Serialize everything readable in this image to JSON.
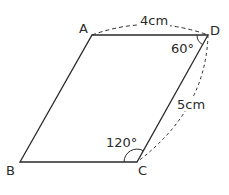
{
  "figure": {
    "type": "parallelogram",
    "vertices": {
      "A": {
        "label": "A",
        "x": 92,
        "y": 35
      },
      "D": {
        "label": "D",
        "x": 208,
        "y": 35
      },
      "B": {
        "label": "B",
        "x": 20,
        "y": 162
      },
      "C": {
        "label": "C",
        "x": 137,
        "y": 162
      }
    },
    "measurements": {
      "AD": "4cm",
      "DC": "5cm",
      "angle_D": "60°",
      "angle_C": "120°"
    },
    "colors": {
      "stroke": "#2a2a2a",
      "background": "#ffffff"
    }
  }
}
